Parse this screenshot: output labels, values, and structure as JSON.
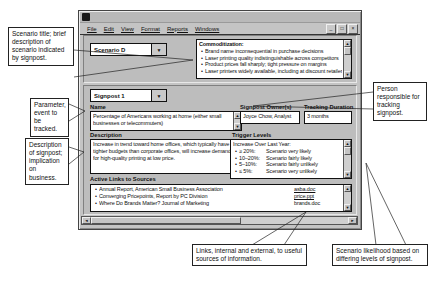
{
  "colors": {
    "window_chrome": "#c4c4c4",
    "field_background": "#ffffff"
  },
  "icons": {
    "dropdown": "▼",
    "scroll_up": "▲",
    "scroll_down": "▼",
    "scroll_left": "◄",
    "scroll_right": "►",
    "bullet": "•",
    "minimize": "_",
    "maximize": "□",
    "close": "×"
  },
  "window": {
    "menu": [
      "File",
      "Edit",
      "View",
      "Format",
      "Reports",
      "Windows"
    ],
    "scenario": {
      "selector_value": "Scenario D",
      "commoditization": {
        "title": "Commoditization:",
        "bullets": [
          "Brand name inconsequential in purchase decisions",
          "Laser printing quality indistinguishable across competitors",
          "Product prices fall sharply; tight pressure on margins",
          "Laser printers widely available, including at discount retailers"
        ]
      }
    },
    "signpost": {
      "selector_value": "Signpost 1",
      "name_label": "Name",
      "name_value": "Percentage of Americans working at home (either small businesses or telecommuters)",
      "owner_label": "Signpost Owner(s)",
      "owner_value": "Joyce Chow, Analyst",
      "tracking_label": "Tracking Duration",
      "tracking_value": "3 months",
      "description_label": "Description",
      "description_value": "Increase in trend toward home offices, which typically have tighter budgets than corporate offices, will increase demand for high-quality printing at low price.",
      "trigger_label": "Trigger Levels",
      "trigger_heading": "Increase Over Last Year:",
      "triggers": [
        {
          "range": "≥ 20%:",
          "likelihood": "Scenario very likely"
        },
        {
          "range": "10–20%:",
          "likelihood": "Scenario fairly likely"
        },
        {
          "range": "5–10%:",
          "likelihood": "Scenario fairly unlikely"
        },
        {
          "range": "≤ 5%:",
          "likelihood": "Scenario very unlikely"
        }
      ],
      "links_label": "Active Links to Sources",
      "links": [
        {
          "source": "Annual Report, American Small Business Association",
          "file": "asba.doc"
        },
        {
          "source": "Converging Pricepoints, Report by PC Division",
          "file": "price.ppt"
        },
        {
          "source": "Where Do Brands Matter? Journal of Marketing",
          "file": "brands.doc"
        }
      ]
    }
  },
  "callouts": {
    "scenario_title": "Scenario title; brief description of scenario indicated by signpost.",
    "parameter": "Parameter, event to be tracked.",
    "description": "Description of signpost; implication on business.",
    "owner": "Person responsible for tracking signpost.",
    "links": "Links, internal and external, to useful sources of information.",
    "likelihood": "Scenario likelihood based on differing levels of signpost."
  }
}
